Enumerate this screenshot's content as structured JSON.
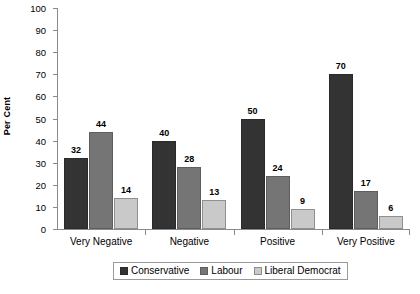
{
  "chart_data": {
    "type": "bar",
    "title": "",
    "subtitle": "",
    "xlabel": "",
    "ylabel": "Per Cent",
    "ylim": [
      0,
      100
    ],
    "ytick_step": 10,
    "ytick_labels": [
      "0",
      "10",
      "20",
      "30",
      "40",
      "50",
      "60",
      "70",
      "80",
      "90",
      "100"
    ],
    "grid": false,
    "legend_position": "bottom-center",
    "value_labels": true,
    "categories": [
      "Very Negative",
      "Negative",
      "Positive",
      "Very Positive"
    ],
    "series": [
      {
        "name": "Conservative",
        "color": "#333333",
        "values": [
          32,
          40,
          50,
          70
        ]
      },
      {
        "name": "Labour",
        "color": "#757575",
        "values": [
          44,
          28,
          24,
          17
        ]
      },
      {
        "name": "Liberal Democrat",
        "color": "#c9c9c9",
        "values": [
          14,
          13,
          9,
          6
        ]
      }
    ]
  },
  "axis": {
    "y_title": "Per Cent",
    "axis_color": "#8a8a8a"
  },
  "legend": {
    "border_color": "#9a9a9a",
    "entries": [
      {
        "label": "Conservative",
        "swatch": "#333333"
      },
      {
        "label": "Labour",
        "swatch": "#757575"
      },
      {
        "label": "Liberal Democrat",
        "swatch": "#c9c9c9"
      }
    ]
  }
}
